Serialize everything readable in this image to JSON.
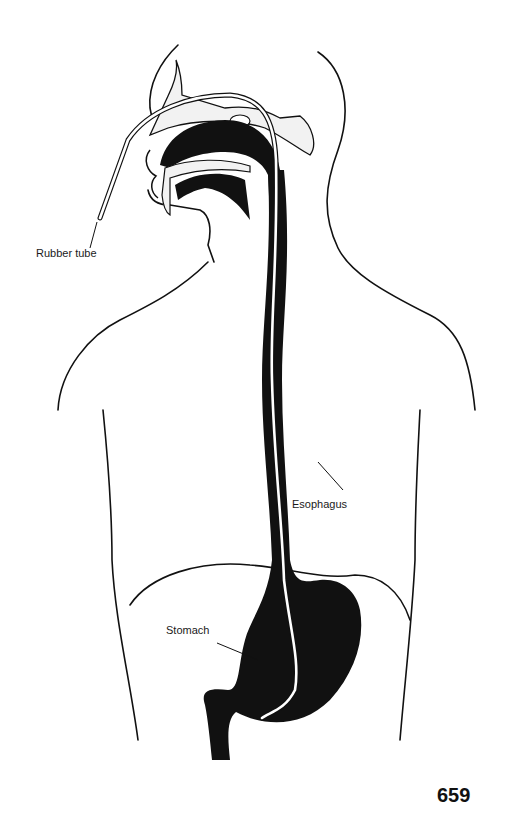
{
  "figure": {
    "colors": {
      "ink": "#111111",
      "paper": "#ffffff",
      "bone": "#f2f2f2"
    }
  },
  "labels": {
    "rubber_tube": "Rubber tube",
    "esophagus": "Esophagus",
    "stomach": "Stomach"
  },
  "page": {
    "number": "659"
  }
}
